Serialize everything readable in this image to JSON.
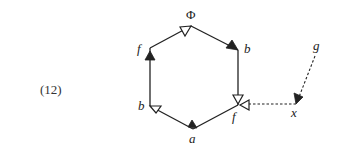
{
  "equation_number": "(12)",
  "diagram": {
    "type": "hexagon-graph",
    "vertices": [
      {
        "id": "top",
        "label": "Φ",
        "x": 191,
        "y": 26
      },
      {
        "id": "upper-right",
        "label": "b",
        "x": 238,
        "y": 50
      },
      {
        "id": "lower-right",
        "label": "f",
        "x": 238,
        "y": 105
      },
      {
        "id": "bottom",
        "label": "a",
        "x": 193,
        "y": 129
      },
      {
        "id": "lower-left",
        "label": "b",
        "x": 150,
        "y": 106
      },
      {
        "id": "upper-left",
        "label": "f",
        "x": 150,
        "y": 48
      },
      {
        "id": "x-node",
        "label": "x",
        "x": 296,
        "y": 104
      },
      {
        "id": "g-node",
        "label": "g",
        "x": 316,
        "y": 54
      }
    ],
    "edges": [
      {
        "from": "upper-left",
        "to": "top",
        "style": "solid",
        "arrow": "hollow"
      },
      {
        "from": "top",
        "to": "upper-right",
        "style": "solid",
        "arrow": "filled"
      },
      {
        "from": "upper-right",
        "to": "lower-right",
        "style": "solid",
        "arrow": "hollow"
      },
      {
        "from": "lower-right",
        "to": "bottom",
        "style": "solid",
        "arrow": "filled"
      },
      {
        "from": "bottom",
        "to": "lower-left",
        "style": "solid",
        "arrow": "hollow"
      },
      {
        "from": "lower-left",
        "to": "upper-left",
        "style": "solid",
        "arrow": "filled"
      },
      {
        "from": "x-node",
        "to": "lower-right",
        "style": "dashed",
        "arrow": "hollow"
      },
      {
        "from": "g-node",
        "to": "x-node",
        "style": "dashed",
        "arrow": "filled"
      }
    ]
  },
  "labels": {
    "phi": "Φ",
    "upper_right": "b",
    "lower_right": "f",
    "bottom": "a",
    "lower_left": "b",
    "upper_left": "f",
    "x": "x",
    "g": "g"
  }
}
